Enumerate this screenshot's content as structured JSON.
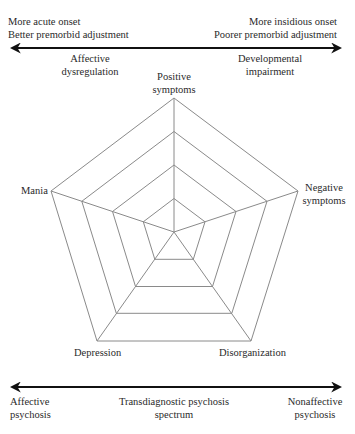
{
  "top_axis": {
    "left_line1": "More acute onset",
    "left_line2": "Better premorbid adjustment",
    "right_line1": "More insidious onset",
    "right_line2": "Poorer premorbid adjustment",
    "left_sub_line1": "Affective",
    "left_sub_line2": "dysregulation",
    "right_sub_line1": "Developmental",
    "right_sub_line2": "impairment"
  },
  "radar": {
    "axes": [
      {
        "line1": "Positive",
        "line2": "symptoms"
      },
      {
        "line1": "Negative",
        "line2": "symptoms"
      },
      {
        "line1": "Disorganization",
        "line2": ""
      },
      {
        "line1": "Depression",
        "line2": ""
      },
      {
        "line1": "Mania",
        "line2": ""
      }
    ],
    "rings": 4,
    "line_color": "#8a8a8a"
  },
  "bottom_axis": {
    "left_line1": "Affective",
    "left_line2": "psychosis",
    "center_line1": "Transdiagnostic psychosis",
    "center_line2": "spectrum",
    "right_line1": "Nonaffective",
    "right_line2": "psychosis"
  },
  "colors": {
    "arrow": "#111111",
    "grid": "#8a8a8a",
    "text": "#2a2a2a"
  }
}
